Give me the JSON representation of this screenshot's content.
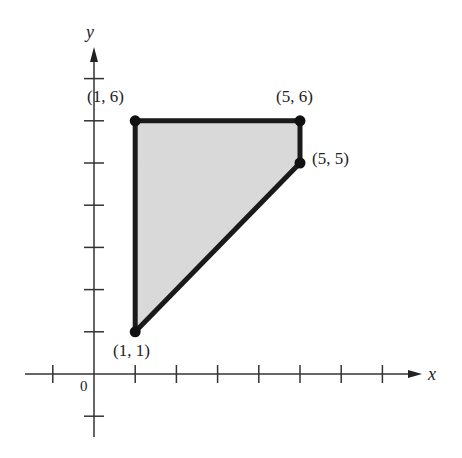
{
  "diagram": {
    "type": "coordinate-plane-region",
    "axes": {
      "x_label": "x",
      "y_label": "y",
      "origin_label": "0",
      "x_ticks": [
        -1,
        1,
        2,
        3,
        4,
        5,
        6,
        7
      ],
      "y_ticks": [
        -1,
        1,
        2,
        3,
        4,
        5,
        6,
        7
      ]
    },
    "region": {
      "fill": "#d9d9d9",
      "stroke": "#1a1a1a",
      "vertices": [
        {
          "x": 1,
          "y": 1,
          "label": "(1, 1)"
        },
        {
          "x": 1,
          "y": 6,
          "label": "(1, 6)"
        },
        {
          "x": 5,
          "y": 6,
          "label": "(5, 6)"
        },
        {
          "x": 5,
          "y": 5,
          "label": "(5, 5)"
        }
      ]
    }
  }
}
